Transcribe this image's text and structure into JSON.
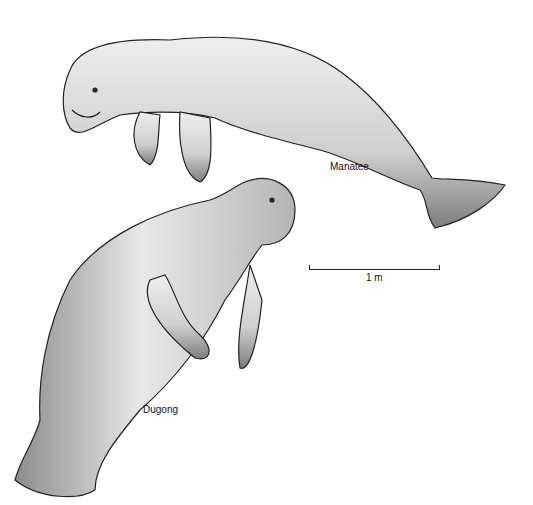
{
  "figure": {
    "subjects": [
      {
        "name": "Manatee",
        "label": "Manatee"
      },
      {
        "name": "Dugong",
        "label": "Dugong"
      }
    ],
    "scale_bar": {
      "label": "1 m"
    },
    "colors": {
      "body_fill": "#d9d9d9",
      "shadow": "#8a8a8a",
      "outline": "#222222",
      "background": "#ffffff"
    }
  }
}
